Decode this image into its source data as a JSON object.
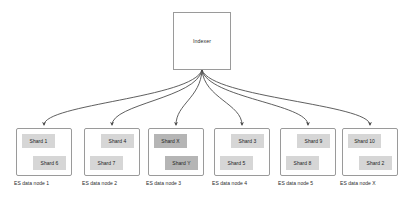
{
  "diagram": {
    "root": {
      "label": "Indexer"
    },
    "colors": {
      "shard_normal": "#d6d6d6",
      "shard_highlight": "#b5b5b5",
      "box_border": "#9a9a9a",
      "edge": "#4d4d4d",
      "background": "#ffffff",
      "text": "#222222"
    },
    "nodes": [
      {
        "caption": "ES data node 1",
        "shards": [
          {
            "label": "Shard 1",
            "position": "top-left",
            "highlight": false
          },
          {
            "label": "Shard 6",
            "position": "bottom-right",
            "highlight": false
          }
        ]
      },
      {
        "caption": "ES data node 2",
        "shards": [
          {
            "label": "Shard 4",
            "position": "top-right",
            "highlight": false
          },
          {
            "label": "Shard 7",
            "position": "bottom-left",
            "highlight": false
          }
        ]
      },
      {
        "caption": "ES data node 3",
        "shards": [
          {
            "label": "Shard X",
            "position": "top-left",
            "highlight": true
          },
          {
            "label": "Shard Y",
            "position": "bottom-right",
            "highlight": true
          }
        ]
      },
      {
        "caption": "ES data node 4",
        "shards": [
          {
            "label": "Shard 3",
            "position": "top-right",
            "highlight": false
          },
          {
            "label": "Shard 5",
            "position": "bottom-left",
            "highlight": false
          }
        ]
      },
      {
        "caption": "ES data node 5",
        "shards": [
          {
            "label": "Shard 9",
            "position": "top-right",
            "highlight": false
          },
          {
            "label": "Shard 8",
            "position": "bottom-left",
            "highlight": false
          }
        ]
      },
      {
        "caption": "ES data node X",
        "shards": [
          {
            "label": "Shard 10",
            "position": "top-left",
            "highlight": false
          },
          {
            "label": "Shard 2",
            "position": "bottom-right",
            "highlight": false
          }
        ]
      }
    ],
    "edges": [
      {
        "from": "Indexer",
        "to": "ES data node 1"
      },
      {
        "from": "Indexer",
        "to": "ES data node 2"
      },
      {
        "from": "Indexer",
        "to": "ES data node 3"
      },
      {
        "from": "Indexer",
        "to": "ES data node 4"
      },
      {
        "from": "Indexer",
        "to": "ES data node 5"
      },
      {
        "from": "Indexer",
        "to": "ES data node X"
      }
    ]
  }
}
